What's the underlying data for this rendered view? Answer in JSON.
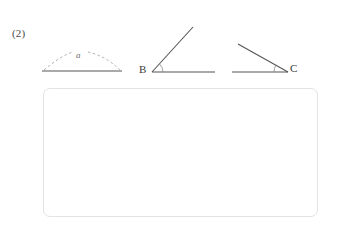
{
  "page": {
    "background_color": "#ffffff",
    "width": 340,
    "height": 231
  },
  "problem": {
    "number_label": "(2)",
    "figure_ink_color": "#555555",
    "dashed_ink_color": "#9a9a9a"
  },
  "figures": {
    "arc_figure": {
      "name": "segment-with-dashed-arc",
      "arc_label": "a",
      "baseline": {
        "x1": 42,
        "y1": 71,
        "x2": 122,
        "y2": 71
      },
      "arc": {
        "start_x": 44,
        "start_y": 70,
        "peak_x": 83,
        "peak_y": 53,
        "end_x": 120,
        "end_y": 70
      },
      "arc_style": "dashed"
    },
    "angle_b": {
      "name": "angle-at-vertex-b",
      "vertex_label": "B",
      "vertex": {
        "x": 152,
        "y": 72
      },
      "ray_horizontal_end": {
        "x": 215,
        "y": 72
      },
      "ray_slanted_end": {
        "x": 193,
        "y": 27
      },
      "angle_arc_radius": 11,
      "opens": "up-right"
    },
    "angle_c": {
      "name": "angle-at-vertex-c",
      "vertex_label": "C",
      "vertex": {
        "x": 288,
        "y": 72
      },
      "ray_horizontal_end": {
        "x": 232,
        "y": 72
      },
      "ray_slanted_end": {
        "x": 238,
        "y": 44
      },
      "angle_arc_radius": 14,
      "opens": "up-left"
    }
  },
  "answer_box": {
    "name": "answer-area",
    "content": "",
    "border_color": "#e3e3e3",
    "x": 43,
    "y": 88,
    "width": 275,
    "height": 129
  }
}
